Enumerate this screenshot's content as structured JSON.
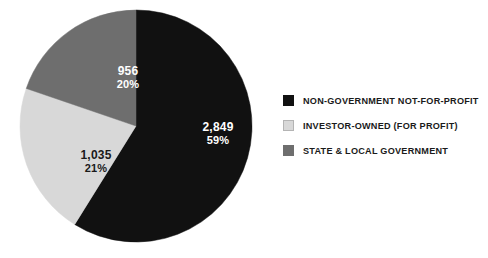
{
  "chart_data": {
    "type": "pie",
    "title": "",
    "subtitle": "",
    "xlabel": "",
    "ylabel": "",
    "grid": false,
    "legend_position": "right",
    "start_angle_deg": 0,
    "direction": "clockwise",
    "total": 4840,
    "categories": [
      "NON-GOVERNMENT NOT-FOR-PROFIT",
      "INVESTOR-OWNED (FOR PROFIT)",
      "STATE & LOCAL GOVERNMENT"
    ],
    "values": [
      2849,
      1035,
      956
    ],
    "value_labels": [
      "2,849",
      "1,035",
      "956"
    ],
    "percent_labels": [
      "59%",
      "21%",
      "20%"
    ],
    "percents": [
      59,
      21,
      20
    ],
    "colors": [
      "#111111",
      "#d8d8d8",
      "#6e6e6e"
    ],
    "label_text_colors": [
      "#ffffff",
      "#1a1a1a",
      "#ffffff"
    ],
    "slices": [
      {
        "name": "NON-GOVERNMENT NOT-FOR-PROFIT",
        "value": 2849,
        "value_label": "2,849",
        "percent": 59,
        "percent_label": "59%",
        "color": "#111111"
      },
      {
        "name": "INVESTOR-OWNED (FOR PROFIT)",
        "value": 1035,
        "value_label": "1,035",
        "percent": 21,
        "percent_label": "21%",
        "color": "#d8d8d8"
      },
      {
        "name": "STATE & LOCAL GOVERNMENT",
        "value": 956,
        "value_label": "956",
        "percent": 20,
        "percent_label": "20%",
        "color": "#6e6e6e"
      }
    ]
  },
  "legend": {
    "items": [
      {
        "label": "NON-GOVERNMENT NOT-FOR-PROFIT",
        "color": "#111111",
        "swatch_border": "#111111"
      },
      {
        "label": "INVESTOR-OWNED (FOR PROFIT)",
        "color": "#d8d8d8",
        "swatch_border": "#b4b4b4"
      },
      {
        "label": "STATE & LOCAL GOVERNMENT",
        "color": "#6e6e6e",
        "swatch_border": "#6e6e6e"
      }
    ]
  },
  "canvas": {
    "background": "#ffffff"
  }
}
